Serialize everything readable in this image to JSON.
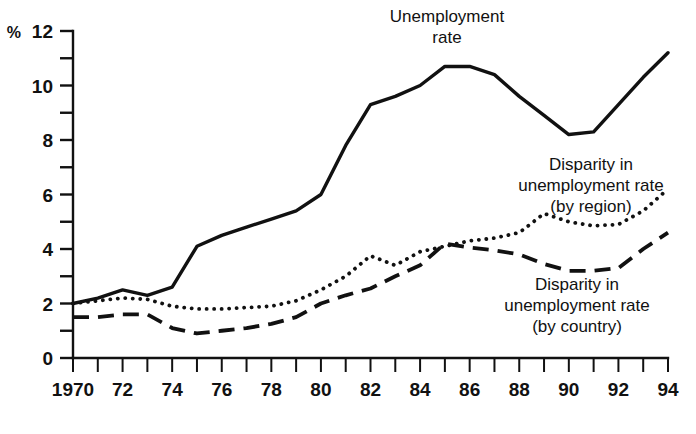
{
  "chart_data": {
    "type": "line",
    "title": "",
    "subtitle": "",
    "xlabel": "",
    "ylabel": "%",
    "unit_label": "%",
    "xlim": [
      1970,
      1994
    ],
    "ylim": [
      0,
      12
    ],
    "grid": false,
    "legend_position": "inline-annotations",
    "y_ticks_major": [
      0,
      2,
      4,
      6,
      8,
      10,
      12
    ],
    "y_ticks_minor": [
      1,
      3,
      5,
      7,
      9,
      11
    ],
    "y_tick_labels": [
      "0",
      "2",
      "4",
      "6",
      "8",
      "10",
      "12"
    ],
    "x": [
      1970,
      1971,
      1972,
      1973,
      1974,
      1975,
      1976,
      1977,
      1978,
      1979,
      1980,
      1981,
      1982,
      1983,
      1984,
      1985,
      1986,
      1987,
      1988,
      1989,
      1990,
      1991,
      1992,
      1993,
      1994
    ],
    "x_tick_labels": [
      "1970",
      "",
      "72",
      "",
      "74",
      "",
      "76",
      "",
      "78",
      "",
      "80",
      "",
      "82",
      "",
      "84",
      "",
      "86",
      "",
      "88",
      "",
      "90",
      "",
      "92",
      "",
      "94"
    ],
    "series": [
      {
        "name": "Unemployment rate",
        "style": "solid",
        "values": [
          2.0,
          2.2,
          2.5,
          2.3,
          2.6,
          4.1,
          4.5,
          4.8,
          5.1,
          5.4,
          6.0,
          7.8,
          9.3,
          9.6,
          10.0,
          10.7,
          10.7,
          10.4,
          9.6,
          8.9,
          8.2,
          8.3,
          9.3,
          10.3,
          11.2
        ]
      },
      {
        "name": "Disparity in unemployment rate (by region)",
        "style": "dotted",
        "values": [
          2.0,
          2.1,
          2.2,
          2.15,
          1.9,
          1.8,
          1.8,
          1.85,
          1.9,
          2.1,
          2.5,
          3.0,
          3.75,
          3.4,
          3.9,
          4.1,
          4.3,
          4.4,
          4.6,
          5.3,
          5.0,
          4.85,
          4.9,
          5.4,
          6.2
        ]
      },
      {
        "name": "Disparity in unemployment rate (by country)",
        "style": "dashed",
        "values": [
          1.5,
          1.5,
          1.6,
          1.6,
          1.1,
          0.9,
          1.0,
          1.1,
          1.25,
          1.5,
          2.0,
          2.3,
          2.55,
          3.0,
          3.4,
          4.2,
          4.05,
          3.95,
          3.8,
          3.45,
          3.2,
          3.2,
          3.3,
          4.0,
          4.6
        ]
      }
    ],
    "annotations": [
      {
        "id": "unemployment-rate-label",
        "lines": [
          "Unemployment",
          "rate"
        ],
        "x_px": 447,
        "y_px": 22
      },
      {
        "id": "disparity-by-region-label",
        "lines": [
          "Disparity in",
          "unemployment rate",
          "(by region)"
        ],
        "x_px": 591,
        "y_px": 170
      },
      {
        "id": "disparity-by-country-label",
        "lines": [
          "Disparity in",
          "unemployment rate",
          "(by country)"
        ],
        "x_px": 577,
        "y_px": 290
      }
    ],
    "colors": {
      "ink": "#111111",
      "background": "#ffffff"
    }
  }
}
